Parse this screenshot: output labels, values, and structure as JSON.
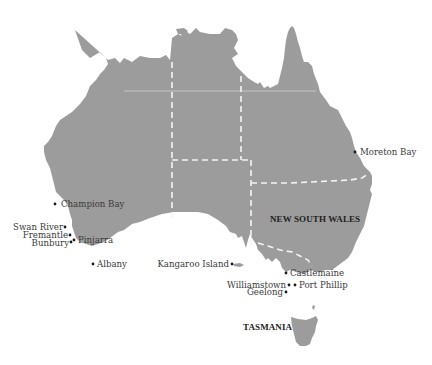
{
  "map": {
    "title": "",
    "land_color": "#9c9c9c",
    "background_color": "#ffffff",
    "border_color": "#f4f4f4",
    "regions": [
      {
        "id": "nsw",
        "label": "NEW SOUTH WALES"
      },
      {
        "id": "tas",
        "label": "TASMANIA"
      }
    ],
    "places": [
      {
        "id": "moreton-bay",
        "label": "Moreton Bay"
      },
      {
        "id": "champion-bay",
        "label": "Champion Bay"
      },
      {
        "id": "swan-river",
        "label": "Swan River"
      },
      {
        "id": "fremantle",
        "label": "Fremantle"
      },
      {
        "id": "bunbury",
        "label": "Bunbury"
      },
      {
        "id": "pinjarra",
        "label": "Pinjarra"
      },
      {
        "id": "albany",
        "label": "Albany"
      },
      {
        "id": "kangaroo-island",
        "label": "Kangaroo Island"
      },
      {
        "id": "castlemaine",
        "label": "Castlemaine"
      },
      {
        "id": "williamstown",
        "label": "Williamstown"
      },
      {
        "id": "port-phillip",
        "label": "Port Phillip"
      },
      {
        "id": "geelong",
        "label": "Geelong"
      }
    ]
  }
}
